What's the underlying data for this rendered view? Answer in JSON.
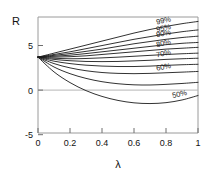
{
  "chart_data": {
    "type": "line",
    "title": "",
    "xlabel": "λ",
    "ylabel": "R",
    "xlim": [
      0,
      1
    ],
    "ylim": [
      -5,
      8
    ],
    "grid": false,
    "legend_position": "inline-right-labels",
    "xticks": [
      "0",
      "0.2",
      "0.4",
      "0.6",
      "0.8",
      "1"
    ],
    "xtick_values": [
      0,
      0.2,
      0.4,
      0.6,
      0.8,
      1
    ],
    "yticks": [
      "5",
      "0",
      "-5"
    ],
    "ytick_values": [
      5,
      0,
      -5
    ],
    "x": [
      0,
      0.1,
      0.2,
      0.3,
      0.4,
      0.5,
      0.6,
      0.7,
      0.8,
      0.9,
      1
    ],
    "common_origin": {
      "x": 0,
      "y": 3.5
    },
    "series": [
      {
        "name": "99%",
        "label": "99%",
        "values": [
          3.5,
          3.95,
          4.4,
          4.85,
          5.3,
          5.75,
          6.2,
          6.6,
          6.95,
          7.25,
          7.5
        ]
      },
      {
        "name": "95%",
        "label": "95%",
        "values": [
          3.5,
          3.8,
          4.1,
          4.45,
          4.8,
          5.15,
          5.5,
          5.8,
          6.1,
          6.35,
          6.55
        ]
      },
      {
        "name": "90%",
        "label": "90%",
        "values": [
          3.5,
          3.7,
          3.9,
          4.15,
          4.4,
          4.7,
          5.0,
          5.25,
          5.5,
          5.7,
          5.85
        ]
      },
      {
        "name": "85%",
        "label": "",
        "values": [
          3.5,
          3.6,
          3.72,
          3.9,
          4.1,
          4.3,
          4.5,
          4.7,
          4.9,
          5.05,
          5.15
        ]
      },
      {
        "name": "80%",
        "label": "80%",
        "values": [
          3.5,
          3.5,
          3.55,
          3.65,
          3.8,
          3.95,
          4.1,
          4.25,
          4.4,
          4.5,
          4.6
        ]
      },
      {
        "name": "75%",
        "label": "",
        "values": [
          3.5,
          3.38,
          3.32,
          3.35,
          3.42,
          3.5,
          3.6,
          3.7,
          3.8,
          3.88,
          3.95
        ]
      },
      {
        "name": "70%",
        "label": "70%",
        "values": [
          3.5,
          3.25,
          3.1,
          3.02,
          3.0,
          3.02,
          3.08,
          3.15,
          3.25,
          3.32,
          3.38
        ]
      },
      {
        "name": "65%",
        "label": "",
        "values": [
          3.5,
          3.05,
          2.78,
          2.6,
          2.5,
          2.45,
          2.45,
          2.5,
          2.58,
          2.65,
          2.7
        ]
      },
      {
        "name": "60%",
        "label": "60%",
        "values": [
          3.5,
          2.78,
          2.3,
          1.98,
          1.78,
          1.68,
          1.65,
          1.68,
          1.75,
          1.82,
          1.9
        ]
      },
      {
        "name": "55%",
        "label": "",
        "values": [
          3.5,
          2.4,
          1.65,
          1.12,
          0.75,
          0.52,
          0.4,
          0.38,
          0.45,
          0.55,
          0.68
        ]
      },
      {
        "name": "50%",
        "label": "50%",
        "values": [
          3.5,
          1.85,
          0.65,
          -0.25,
          -0.9,
          -1.35,
          -1.62,
          -1.7,
          -1.6,
          -1.3,
          -0.8
        ]
      }
    ]
  },
  "axes": {
    "y_axis_label": "R",
    "x_axis_label": "λ"
  }
}
